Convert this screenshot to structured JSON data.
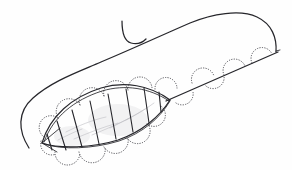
{
  "canvas": {
    "width": 292,
    "height": 170,
    "background_color": "#fefefe",
    "title": "Hand-drawn leaf with scalloped dotted margin"
  },
  "palette": {
    "ink": "#26262b",
    "dotted_ink": "#4a4a50",
    "pencil": "#b9b9be",
    "paper": "#fefefe"
  },
  "strokes": {
    "sweeping_curve": {
      "label": "large sweeping S-curve",
      "path": "M 29 148 C 18 131 17 112 33 98 C 52 81 78 72 101 62 C 130 50 160 36 190 23 C 212 14 240 9 257 17 C 272 24 277 38 276 52"
    },
    "hook_mark": {
      "label": "small hook crossing the sweeping curve",
      "path": "M 122 21 C 122 33 124 41 131 43 C 138 45 143 42 146 39"
    },
    "stem_line": {
      "label": "straight stem line to right tip",
      "path": "M 166 101 L 278 52"
    },
    "stem_tip": {
      "label": "right terminal tick of the stem",
      "path": "M 276 51 L 280 50"
    },
    "leaf_upper_edge": {
      "label": "leaf upper outline",
      "path": "M 42 143 C 50 116 72 97 101 88 C 124 81 150 85 170 100"
    },
    "leaf_upper_edge_inner": {
      "label": "leaf upper outline doubled stroke",
      "path": "M 44 142 C 53 117 74 100 102 91 C 125 84 150 88 169 101"
    },
    "leaf_lower_edge": {
      "label": "leaf lower outline",
      "path": "M 42 143 C 60 149 92 148 118 140 C 142 132 160 116 170 100"
    },
    "leaf_lower_edge_inner": {
      "label": "leaf lower outline doubled stroke",
      "path": "M 44 144 C 62 150 93 149 119 141 C 143 133 160 118 170 101"
    },
    "veins": [
      {
        "label": "vein-1",
        "path": "M 47 134 L 52 150"
      },
      {
        "label": "vein-2",
        "path": "M 57 121 L 66 150"
      },
      {
        "label": "vein-3",
        "path": "M 72 110 L 82 147"
      },
      {
        "label": "vein-4",
        "path": "M 90 101 L 99 144"
      },
      {
        "label": "vein-5",
        "path": "M 108 94 L 116 139"
      },
      {
        "label": "vein-6",
        "path": "M 126 89 L 133 132"
      },
      {
        "label": "vein-7",
        "path": "M 144 88 L 149 123"
      },
      {
        "label": "vein-8",
        "path": "M 159 92 L 161 112"
      }
    ],
    "tip_cross": {
      "label": "crossing strokes at left leaf tip",
      "path": "M 42 143 L 60 128 M 42 143 L 57 152"
    },
    "scallops_lower": [
      {
        "label": "scallop-lower-1",
        "path": "M 41 141 A 11 11 0 0 0 56 154"
      },
      {
        "label": "scallop-lower-2",
        "path": "M 55 152 A 12 12 0 0 0 80 153"
      },
      {
        "label": "scallop-lower-3",
        "path": "M 79 152 A 13 13 0 0 0 105 147"
      },
      {
        "label": "scallop-lower-4",
        "path": "M 104 147 A 13 13 0 0 0 128 138"
      },
      {
        "label": "scallop-lower-5",
        "path": "M 127 138 A 12 12 0 0 0 148 124"
      },
      {
        "label": "scallop-lower-6",
        "path": "M 147 124 A 11 11 0 0 0 161 106"
      },
      {
        "label": "scallop-lower-7",
        "path": "M 176 103 A 11 11 0 0 0 193 92"
      },
      {
        "label": "scallop-lower-8",
        "path": "M 206 86 A 11 11 0 0 0 224 76"
      }
    ],
    "scallops_upper": [
      {
        "label": "scallop-upper-1",
        "path": "M 44 137 A 11 11 0 0 1 58 118"
      },
      {
        "label": "scallop-upper-2",
        "path": "M 58 118 A 12 12 0 0 1 80 105"
      },
      {
        "label": "scallop-upper-3",
        "path": "M 80 105 A 12 12 0 0 1 104 96"
      },
      {
        "label": "scallop-upper-4",
        "path": "M 104 96 A 12 12 0 0 1 128 90"
      },
      {
        "label": "scallop-upper-5",
        "path": "M 128 90 A 12 12 0 0 1 152 88"
      },
      {
        "label": "scallop-upper-6",
        "path": "M 155 89 A 11 11 0 0 1 177 88"
      },
      {
        "label": "scallop-upper-7",
        "path": "M 192 83 A 11 11 0 0 1 214 76"
      },
      {
        "label": "scallop-upper-8",
        "path": "M 224 75 A 11 11 0 0 1 245 66"
      },
      {
        "label": "scallop-upper-9",
        "path": "M 252 63 A 10 10 0 0 1 272 54"
      }
    ],
    "pencil_marks": [
      {
        "label": "pencil-blade-1",
        "path": "M 66 132 C 78 126 92 120 106 117"
      },
      {
        "label": "pencil-blade-2",
        "path": "M 74 139 C 88 133 103 127 118 123"
      },
      {
        "label": "pencil-blade-3",
        "path": "M 92 135 C 104 130 118 124 130 118"
      },
      {
        "label": "pencil-blade-4",
        "path": "M 110 128 C 122 122 134 116 145 109"
      },
      {
        "label": "pencil-blade-5",
        "path": "M 58 140 C 66 136 74 132 82 129"
      },
      {
        "label": "pencil-blade-6",
        "path": "M 126 120 C 136 115 146 109 154 103"
      }
    ]
  }
}
